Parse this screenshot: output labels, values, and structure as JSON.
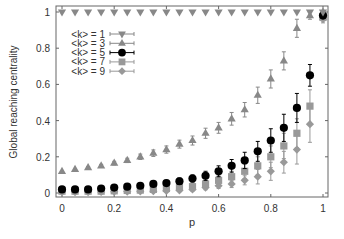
{
  "chart_data": {
    "type": "scatter",
    "title": "",
    "xlabel": "p",
    "ylabel": "Global reaching centrality",
    "xlim": [
      0,
      1
    ],
    "ylim": [
      0,
      1
    ],
    "xticks": [
      0,
      0.2,
      0.4,
      0.6,
      0.8,
      1
    ],
    "xtick_labels": [
      "0",
      "0.2",
      "0.4",
      "0.6",
      "0.8",
      "1"
    ],
    "yticks": [
      0,
      0.2,
      0.4,
      0.6,
      0.8,
      1
    ],
    "ytick_labels": [
      "0",
      "0.2",
      "0.4",
      "0.6",
      "0.8",
      "1"
    ],
    "grid": false,
    "legend_position": "upper left",
    "x": [
      0,
      0.05,
      0.1,
      0.15,
      0.2,
      0.25,
      0.3,
      0.35,
      0.4,
      0.45,
      0.5,
      0.55,
      0.6,
      0.65,
      0.7,
      0.75,
      0.8,
      0.85,
      0.9,
      0.95,
      1.0
    ],
    "series": [
      {
        "name": "<k> = 1",
        "marker": "triangle-down",
        "color": "#888888",
        "values": [
          1,
          1,
          1,
          1,
          1,
          1,
          1,
          1,
          1,
          1,
          1,
          1,
          1,
          1,
          1,
          1,
          1,
          1,
          1,
          1,
          1
        ],
        "errors": [
          0,
          0,
          0,
          0,
          0,
          0,
          0,
          0,
          0,
          0,
          0,
          0,
          0,
          0,
          0,
          0,
          0,
          0,
          0,
          0,
          0
        ]
      },
      {
        "name": "<k> = 3",
        "marker": "triangle-up",
        "color": "#888888",
        "values": [
          0.12,
          0.13,
          0.14,
          0.15,
          0.165,
          0.18,
          0.2,
          0.22,
          0.24,
          0.27,
          0.29,
          0.33,
          0.36,
          0.41,
          0.46,
          0.54,
          0.63,
          0.73,
          0.91,
          0.98,
          1.0
        ],
        "errors": [
          0.005,
          0.005,
          0.006,
          0.008,
          0.01,
          0.012,
          0.015,
          0.018,
          0.02,
          0.022,
          0.025,
          0.028,
          0.03,
          0.035,
          0.04,
          0.045,
          0.05,
          0.05,
          0.05,
          0.02,
          0.005
        ]
      },
      {
        "name": "<k> = 5",
        "marker": "circle",
        "color": "#000000",
        "values": [
          0.02,
          0.02,
          0.02,
          0.025,
          0.03,
          0.035,
          0.04,
          0.05,
          0.055,
          0.065,
          0.08,
          0.095,
          0.12,
          0.15,
          0.18,
          0.23,
          0.29,
          0.36,
          0.47,
          0.65,
          0.98
        ],
        "errors": [
          0.005,
          0.005,
          0.005,
          0.006,
          0.007,
          0.008,
          0.01,
          0.012,
          0.015,
          0.018,
          0.02,
          0.025,
          0.03,
          0.035,
          0.045,
          0.055,
          0.065,
          0.075,
          0.08,
          0.06,
          0.01
        ]
      },
      {
        "name": "<k> = 7",
        "marker": "square",
        "color": "#999999",
        "values": [
          0.01,
          0.01,
          0.01,
          0.01,
          0.012,
          0.014,
          0.016,
          0.02,
          0.025,
          0.03,
          0.035,
          0.05,
          0.07,
          0.09,
          0.12,
          0.15,
          0.2,
          0.26,
          0.33,
          0.48,
          0.97
        ],
        "errors": [
          0.004,
          0.004,
          0.004,
          0.004,
          0.005,
          0.006,
          0.007,
          0.008,
          0.01,
          0.012,
          0.015,
          0.02,
          0.025,
          0.03,
          0.04,
          0.05,
          0.06,
          0.07,
          0.08,
          0.09,
          0.015
        ]
      },
      {
        "name": "<k> = 9",
        "marker": "diamond",
        "color": "#999999",
        "values": [
          0.005,
          0.005,
          0.005,
          0.006,
          0.007,
          0.008,
          0.009,
          0.01,
          0.012,
          0.015,
          0.02,
          0.03,
          0.04,
          0.05,
          0.07,
          0.09,
          0.12,
          0.17,
          0.24,
          0.38,
          0.96
        ],
        "errors": [
          0.003,
          0.003,
          0.003,
          0.003,
          0.004,
          0.004,
          0.005,
          0.005,
          0.006,
          0.008,
          0.01,
          0.012,
          0.015,
          0.02,
          0.025,
          0.04,
          0.05,
          0.06,
          0.08,
          0.1,
          0.02
        ]
      }
    ]
  },
  "legend": {
    "entries": [
      "<k> = 1",
      "<k> = 3",
      "<k> = 5",
      "<k> = 7",
      "<k> = 9"
    ]
  },
  "axes": {
    "xlabel": "p",
    "ylabel": "Global reaching centrality"
  }
}
